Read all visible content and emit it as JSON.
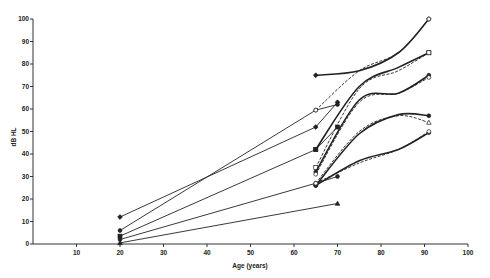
{
  "chart_data": {
    "type": "line",
    "title": "",
    "xlabel": "Age (years)",
    "ylabel": "dB HL",
    "xlim": [
      0,
      100
    ],
    "ylim": [
      0,
      100
    ],
    "grid": false,
    "legend": null,
    "x_ticks": [
      10,
      20,
      30,
      40,
      50,
      60,
      70,
      80,
      90,
      100
    ],
    "y_ticks": [
      0,
      10,
      20,
      30,
      40,
      50,
      60,
      70,
      80,
      90,
      100
    ],
    "series": [
      {
        "name": "young-to-old 1",
        "style": "solid",
        "marker": "filled-diamond",
        "points": [
          [
            20,
            12
          ],
          [
            65,
            52
          ],
          [
            70,
            63
          ]
        ]
      },
      {
        "name": "young-to-old 2",
        "style": "solid",
        "marker": "filled-circle",
        "points": [
          [
            20,
            6
          ],
          [
            65,
            59.5
          ],
          [
            70,
            62
          ]
        ]
      },
      {
        "name": "young-to-old 3",
        "style": "solid",
        "marker": "filled-square",
        "points": [
          [
            20,
            3.5
          ],
          [
            65,
            42
          ],
          [
            70,
            52
          ]
        ]
      },
      {
        "name": "young-to-old 4",
        "style": "solid",
        "marker": "filled-circle",
        "points": [
          [
            20,
            2
          ],
          [
            65,
            27
          ],
          [
            70,
            30
          ]
        ]
      },
      {
        "name": "young-to-old 5",
        "style": "solid",
        "marker": "filled-triangle",
        "points": [
          [
            20,
            0.5
          ],
          [
            70,
            18
          ]
        ]
      },
      {
        "name": "old A",
        "style": "solid",
        "marker": "filled-diamond",
        "points": [
          [
            65,
            75
          ],
          [
            75,
            77
          ],
          [
            84,
            85
          ],
          [
            91,
            100
          ]
        ]
      },
      {
        "name": "old A dashed",
        "style": "dashed",
        "marker": "open-circle",
        "points": [
          [
            65,
            59.5
          ],
          [
            75,
            77
          ],
          [
            84,
            85
          ],
          [
            91,
            100
          ]
        ]
      },
      {
        "name": "old B",
        "style": "solid",
        "marker": "filled-square",
        "points": [
          [
            65,
            42
          ],
          [
            75,
            70
          ],
          [
            84,
            78.5
          ],
          [
            91,
            85
          ]
        ]
      },
      {
        "name": "old B dashed",
        "style": "dashed",
        "marker": "open-square",
        "points": [
          [
            65,
            34
          ],
          [
            75,
            69
          ],
          [
            84,
            77
          ],
          [
            91,
            85
          ]
        ]
      },
      {
        "name": "old C",
        "style": "solid",
        "marker": "filled-circle",
        "points": [
          [
            65,
            32
          ],
          [
            75,
            64
          ],
          [
            84,
            67
          ],
          [
            91,
            75
          ]
        ]
      },
      {
        "name": "old C dashed",
        "style": "dashed",
        "marker": "open-circle",
        "points": [
          [
            65,
            31
          ],
          [
            75,
            63
          ],
          [
            84,
            67
          ],
          [
            91,
            74
          ]
        ]
      },
      {
        "name": "old D",
        "style": "solid",
        "marker": "filled-circle",
        "points": [
          [
            65,
            26
          ],
          [
            75,
            49
          ],
          [
            84,
            57.5
          ],
          [
            91,
            57
          ]
        ]
      },
      {
        "name": "old D dashed",
        "style": "dashed",
        "marker": "open-triangle",
        "points": [
          [
            65,
            27
          ],
          [
            75,
            50
          ],
          [
            84,
            57
          ],
          [
            91,
            54
          ]
        ]
      },
      {
        "name": "old E",
        "style": "solid",
        "marker": "filled-circle",
        "points": [
          [
            65,
            26
          ],
          [
            75,
            37
          ],
          [
            84,
            42
          ],
          [
            91,
            49.5
          ]
        ]
      },
      {
        "name": "old E dashed",
        "style": "dashed",
        "marker": "open-circle",
        "points": [
          [
            65,
            27
          ],
          [
            75,
            36
          ],
          [
            84,
            42
          ],
          [
            91,
            50
          ]
        ]
      }
    ]
  },
  "layout": {
    "plot": {
      "x0": 33,
      "x100": 468,
      "y0": 244,
      "y100": 19
    },
    "ink": "#222222",
    "background": "#ffffff"
  }
}
